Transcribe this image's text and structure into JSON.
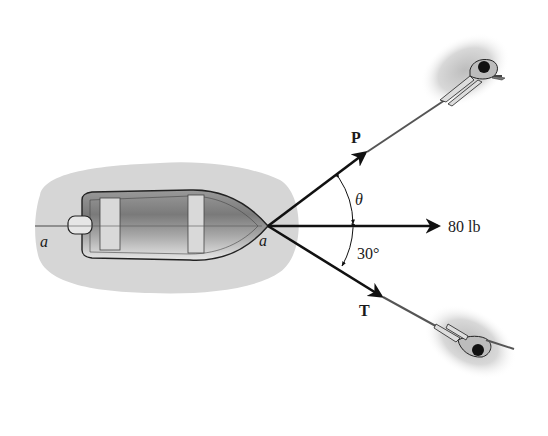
{
  "figure": {
    "point_label_left": "a",
    "point_label_right": "a",
    "force_P_label": "P",
    "force_T_label": "T",
    "resultant_label": "80 lb",
    "angle_theta_label": "θ",
    "angle_30_label": "30°"
  },
  "colors": {
    "arrow": "#111111",
    "water_shadow": "#d4d4d4",
    "rope": "#555555"
  }
}
